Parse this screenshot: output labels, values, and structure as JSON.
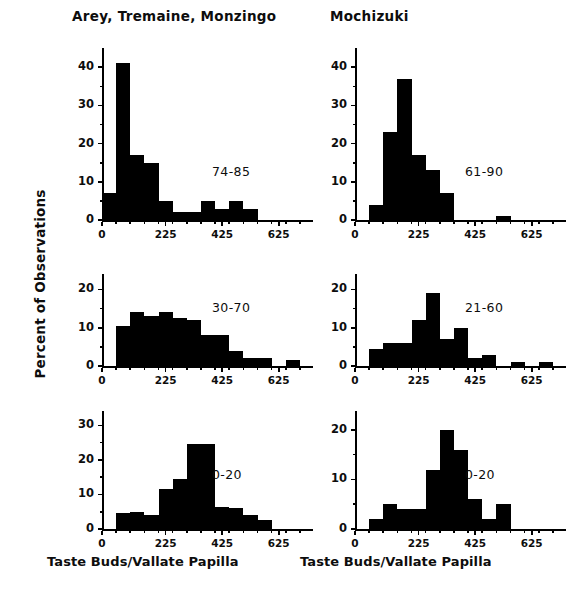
{
  "figure": {
    "column_titles": [
      "Arey, Tremaine, Monzingo",
      "Mochizuki"
    ],
    "y_axis_label": "Percent of Observations",
    "x_axis_captions": [
      "Taste Buds/Vallate Papilla",
      "Taste Buds/Vallate Papilla"
    ],
    "ink_color": "#000000",
    "background_color": "#ffffff"
  },
  "chart_data": [
    {
      "type": "bar",
      "panel": "top-left",
      "title": "Arey, Tremaine, Monzingo",
      "annotation": "74-85",
      "xlabel": "Taste Buds/Vallate Papilla",
      "ylabel": "Percent of Observations",
      "xlim": [
        0,
        725
      ],
      "ylim": [
        0,
        44
      ],
      "xticks": [
        0,
        225,
        425,
        625
      ],
      "xtick_labels": [
        "0",
        "225",
        "425",
        "625"
      ],
      "yticks": [
        0,
        10,
        20,
        30,
        40
      ],
      "ytick_labels": [
        "0",
        "10",
        "20",
        "30",
        "40"
      ],
      "bin_width": 50,
      "grid": false,
      "bin_starts": [
        0,
        50,
        100,
        150,
        200,
        250,
        300,
        350,
        400,
        450,
        500,
        550,
        600,
        650,
        700
      ],
      "values": [
        7,
        41,
        17,
        15,
        5,
        2,
        2,
        5,
        3,
        5,
        3,
        0,
        0,
        0,
        0
      ]
    },
    {
      "type": "bar",
      "panel": "top-right",
      "title": "Mochizuki",
      "annotation": "61-90",
      "xlabel": "Taste Buds/Vallate Papilla",
      "ylabel": "Percent of Observations",
      "xlim": [
        0,
        725
      ],
      "ylim": [
        0,
        44
      ],
      "xticks": [
        0,
        225,
        425,
        625
      ],
      "xtick_labels": [
        "0",
        "225",
        "425",
        "625"
      ],
      "yticks": [
        0,
        10,
        20,
        30,
        40
      ],
      "ytick_labels": [
        "0",
        "10",
        "20",
        "30",
        "40"
      ],
      "bin_width": 50,
      "grid": false,
      "bin_starts": [
        0,
        50,
        100,
        150,
        200,
        250,
        300,
        350,
        400,
        450,
        500,
        550,
        600,
        650,
        700
      ],
      "values": [
        0,
        4,
        23,
        37,
        17,
        13,
        7,
        0,
        0,
        0,
        1,
        0,
        0,
        0,
        0
      ]
    },
    {
      "type": "bar",
      "panel": "middle-left",
      "title": "Arey, Tremaine, Monzingo",
      "annotation": "30-70",
      "xlabel": "Taste Buds/Vallate Papilla",
      "ylabel": "Percent of Observations",
      "xlim": [
        0,
        725
      ],
      "ylim": [
        0,
        23
      ],
      "xticks": [
        0,
        225,
        425,
        625
      ],
      "xtick_labels": [
        "0",
        "225",
        "425",
        "625"
      ],
      "yticks": [
        0,
        10,
        20
      ],
      "ytick_labels": [
        "0",
        "10",
        "20"
      ],
      "bin_width": 50,
      "grid": false,
      "bin_starts": [
        0,
        50,
        100,
        150,
        200,
        250,
        300,
        350,
        400,
        450,
        500,
        550,
        600,
        650,
        700
      ],
      "values": [
        0,
        10.5,
        14,
        13,
        14,
        12.5,
        12,
        8,
        8,
        4,
        2,
        2,
        0,
        1.5,
        0
      ]
    },
    {
      "type": "bar",
      "panel": "middle-right",
      "title": "Mochizuki",
      "annotation": "21-60",
      "xlabel": "Taste Buds/Vallate Papilla",
      "ylabel": "Percent of Observations",
      "xlim": [
        0,
        725
      ],
      "ylim": [
        0,
        23
      ],
      "xticks": [
        0,
        225,
        425,
        625
      ],
      "xtick_labels": [
        "0",
        "225",
        "425",
        "625"
      ],
      "yticks": [
        0,
        10,
        20
      ],
      "ytick_labels": [
        "0",
        "10",
        "20"
      ],
      "bin_width": 50,
      "grid": false,
      "bin_starts": [
        0,
        50,
        100,
        150,
        200,
        250,
        300,
        350,
        400,
        450,
        500,
        550,
        600,
        650,
        700
      ],
      "values": [
        0,
        4.5,
        6,
        6,
        12,
        19,
        7,
        10,
        2,
        3,
        0,
        1,
        0,
        1,
        0
      ]
    },
    {
      "type": "bar",
      "panel": "bottom-left",
      "title": "Arey, Tremaine, Monzingo",
      "annotation": "0-20",
      "xlabel": "Taste Buds/Vallate Papilla",
      "ylabel": "Percent of Observations",
      "xlim": [
        0,
        725
      ],
      "ylim": [
        0,
        33
      ],
      "xticks": [
        0,
        225,
        425,
        625
      ],
      "xtick_labels": [
        "0",
        "225",
        "425",
        "625"
      ],
      "yticks": [
        0,
        10,
        20,
        30
      ],
      "ytick_labels": [
        "0",
        "10",
        "20",
        "30"
      ],
      "bin_width": 50,
      "grid": false,
      "bin_starts": [
        0,
        50,
        100,
        150,
        200,
        250,
        300,
        350,
        400,
        450,
        500,
        550,
        600,
        650,
        700
      ],
      "values": [
        0,
        4.5,
        5,
        4,
        11.5,
        14.5,
        24.5,
        24.5,
        6.5,
        6,
        4,
        2.5,
        0,
        0,
        0
      ]
    },
    {
      "type": "bar",
      "panel": "bottom-right",
      "title": "Mochizuki",
      "annotation": "0-20",
      "xlabel": "Taste Buds/Vallate Papilla",
      "ylabel": "Percent of Observations",
      "xlim": [
        0,
        725
      ],
      "ylim": [
        0,
        23
      ],
      "xticks": [
        0,
        225,
        425,
        625
      ],
      "xtick_labels": [
        "0",
        "225",
        "425",
        "625"
      ],
      "yticks": [
        0,
        10,
        20
      ],
      "ytick_labels": [
        "0",
        "10",
        "20"
      ],
      "bin_width": 50,
      "grid": false,
      "bin_starts": [
        0,
        50,
        100,
        150,
        200,
        250,
        300,
        350,
        400,
        450,
        500,
        550,
        600,
        650,
        700
      ],
      "values": [
        0,
        2,
        5,
        4,
        4,
        12,
        20,
        16,
        6,
        2,
        5,
        0,
        0,
        0,
        0
      ]
    }
  ]
}
